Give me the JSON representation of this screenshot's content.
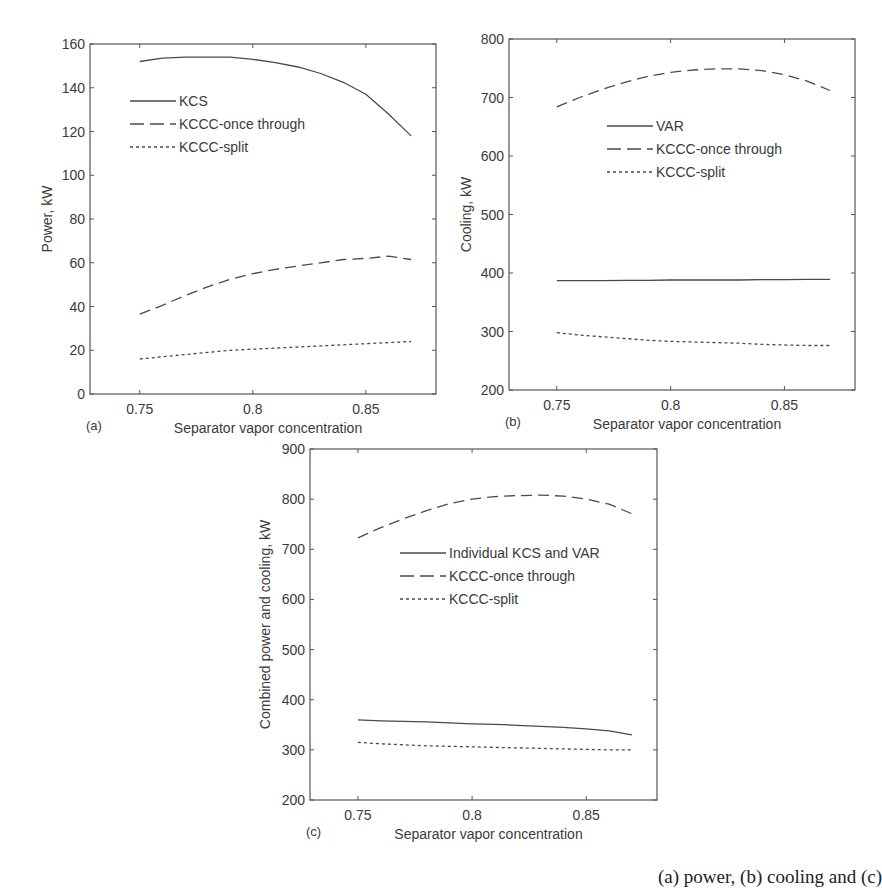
{
  "figure": {
    "caption_visible_fragment": "(a) power, (b) cooling and (c)"
  },
  "chart_data": [
    {
      "id": "a",
      "panel_label": "(a)",
      "type": "line",
      "title": "",
      "xlabel": "Separator vapor concentration",
      "ylabel": "Power, kW",
      "xlim": [
        0.728,
        0.881
      ],
      "ylim": [
        0,
        160
      ],
      "xticks": [
        0.75,
        0.8,
        0.85
      ],
      "xtick_labels": [
        "0.75",
        "0.8",
        "0.85"
      ],
      "yticks": [
        0,
        20,
        40,
        60,
        80,
        100,
        120,
        140,
        160
      ],
      "ytick_labels": [
        "0",
        "20",
        "40",
        "60",
        "80",
        "100",
        "120",
        "140",
        "160"
      ],
      "grid": false,
      "legend_position": "upper-left-inside",
      "frame": {
        "x": 90,
        "y": 44,
        "w": 346,
        "h": 350
      },
      "legend": {
        "x": 130,
        "y": 101
      },
      "x": [
        0.75,
        0.76,
        0.77,
        0.78,
        0.79,
        0.8,
        0.81,
        0.82,
        0.83,
        0.84,
        0.85,
        0.86,
        0.87
      ],
      "series": [
        {
          "name": "KCS",
          "style": "solid",
          "values": [
            152,
            153.5,
            154,
            154,
            154,
            153,
            151.5,
            149.5,
            146.5,
            142.5,
            137,
            128,
            118
          ]
        },
        {
          "name": "KCCC-once through",
          "style": "dashed",
          "values": [
            36.5,
            40.5,
            45,
            49,
            52.5,
            55,
            57,
            58.5,
            60,
            61.5,
            62,
            63,
            61.5
          ]
        },
        {
          "name": "KCCC-split",
          "style": "dotted",
          "values": [
            16,
            17,
            18,
            19,
            20,
            20.5,
            21,
            21.5,
            22,
            22.5,
            23,
            23.5,
            24
          ]
        }
      ]
    },
    {
      "id": "b",
      "panel_label": "(b)",
      "type": "line",
      "title": "",
      "xlabel": "Separator vapor concentration",
      "ylabel": "Cooling, kW",
      "xlim": [
        0.729,
        0.881
      ],
      "ylim": [
        200,
        800
      ],
      "xticks": [
        0.75,
        0.8,
        0.85
      ],
      "xtick_labels": [
        "0.75",
        "0.8",
        "0.85"
      ],
      "yticks": [
        200,
        300,
        400,
        500,
        600,
        700,
        800
      ],
      "ytick_labels": [
        "200",
        "300",
        "400",
        "500",
        "600",
        "700",
        "800"
      ],
      "grid": false,
      "legend_position": "upper-center-inside",
      "frame": {
        "x": 509,
        "y": 39,
        "w": 346,
        "h": 351
      },
      "legend": {
        "x": 607,
        "y": 126
      },
      "x": [
        0.75,
        0.76,
        0.77,
        0.78,
        0.79,
        0.8,
        0.81,
        0.82,
        0.83,
        0.84,
        0.85,
        0.86,
        0.87
      ],
      "series": [
        {
          "name": "VAR",
          "style": "solid",
          "values": [
            387,
            387,
            387,
            387.5,
            387.5,
            388,
            388,
            388,
            388,
            388.5,
            388.5,
            389,
            389
          ]
        },
        {
          "name": "KCCC-once through",
          "style": "dashed",
          "values": [
            684,
            700,
            714,
            726,
            736,
            743,
            747,
            749,
            749,
            746,
            739,
            728,
            712
          ]
        },
        {
          "name": "KCCC-split",
          "style": "dotted",
          "values": [
            298,
            294,
            291,
            288,
            285,
            283,
            282,
            281,
            280,
            278,
            277,
            276,
            276
          ]
        }
      ]
    },
    {
      "id": "c",
      "panel_label": "(c)",
      "type": "line",
      "title": "",
      "xlabel": "Separator vapor concentration",
      "ylabel": "Combined power and cooling, kW",
      "xlim": [
        0.729,
        0.881
      ],
      "ylim": [
        200,
        900
      ],
      "xticks": [
        0.75,
        0.8,
        0.85
      ],
      "xtick_labels": [
        "0.75",
        "0.8",
        "0.85"
      ],
      "yticks": [
        200,
        300,
        400,
        500,
        600,
        700,
        800,
        900
      ],
      "ytick_labels": [
        "200",
        "300",
        "400",
        "500",
        "600",
        "700",
        "800",
        "900"
      ],
      "grid": false,
      "legend_position": "center-inside",
      "frame": {
        "x": 310,
        "y": 449,
        "w": 347,
        "h": 351
      },
      "legend": {
        "x": 400,
        "y": 553
      },
      "x": [
        0.75,
        0.76,
        0.77,
        0.78,
        0.79,
        0.8,
        0.81,
        0.82,
        0.83,
        0.84,
        0.85,
        0.86,
        0.87
      ],
      "series": [
        {
          "name": "Individual KCS and VAR",
          "style": "solid",
          "values": [
            360,
            358,
            357,
            356,
            354,
            352,
            351,
            349,
            347,
            345,
            342,
            338,
            330
          ]
        },
        {
          "name": "KCCC-once through",
          "style": "dashed",
          "values": [
            723,
            743,
            761,
            777,
            791,
            800,
            805,
            807,
            808,
            806,
            800,
            790,
            771
          ]
        },
        {
          "name": "KCCC-split",
          "style": "dotted",
          "values": [
            315,
            312,
            310,
            308,
            307,
            306,
            305,
            304,
            303,
            302,
            301,
            300,
            300
          ]
        }
      ]
    }
  ],
  "colors": {
    "axis": "#555555",
    "line": "#4a4a4a",
    "text": "#3a3a3a"
  }
}
